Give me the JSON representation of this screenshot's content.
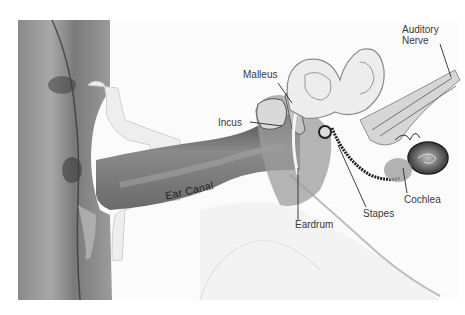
{
  "diagram": {
    "labels": {
      "auditory_nerve_line1": "Auditory",
      "auditory_nerve_line2": "Nerve",
      "malleus": "Malleus",
      "incus": "Incus",
      "ear_canal": "Ear Canal",
      "eardrum": "Eardrum",
      "stapes": "Stapes",
      "cochlea": "Cochlea"
    },
    "colors": {
      "background": "#ffffff",
      "skin_dark": "#6e6e6e",
      "skin_mid": "#9a9a9a",
      "bone_light": "#f2f2f2",
      "canal": "#7d7d7d",
      "leader_line": "#2a2a2a"
    }
  }
}
